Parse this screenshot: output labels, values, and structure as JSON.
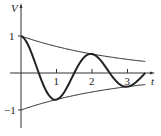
{
  "chart_data": {
    "type": "line",
    "title": "",
    "xlabel": "t",
    "ylabel": "V",
    "xlim": [
      0,
      3.5
    ],
    "ylim": [
      -1.2,
      1.4
    ],
    "grid": false,
    "legend": null,
    "x_ticks": [
      "1",
      "2",
      "3"
    ],
    "y_ticks": [
      "1",
      "-1"
    ],
    "series": [
      {
        "name": "damped oscillation",
        "formula": "e^(-t/3) cos(pi t)",
        "style": "thick",
        "x": [
          0,
          0.25,
          0.5,
          0.75,
          1.0,
          1.25,
          1.5,
          1.75,
          2.0,
          2.25,
          2.5,
          2.75,
          3.0,
          3.25,
          3.5
        ],
        "values": [
          1.0,
          0.65,
          0.0,
          -0.55,
          -0.72,
          -0.48,
          0.0,
          0.39,
          0.51,
          0.34,
          0.0,
          -0.28,
          -0.37,
          -0.24,
          0.0
        ]
      },
      {
        "name": "upper envelope",
        "formula": "e^(-t/3)",
        "style": "thin",
        "x": [
          0,
          1,
          2,
          3,
          3.5
        ],
        "values": [
          1.0,
          0.72,
          0.51,
          0.37,
          0.31
        ]
      },
      {
        "name": "lower envelope",
        "formula": "-e^(-t/3)",
        "style": "thin",
        "x": [
          0,
          1,
          2,
          3,
          3.5
        ],
        "values": [
          -1.0,
          -0.72,
          -0.51,
          -0.37,
          -0.31
        ]
      }
    ]
  }
}
